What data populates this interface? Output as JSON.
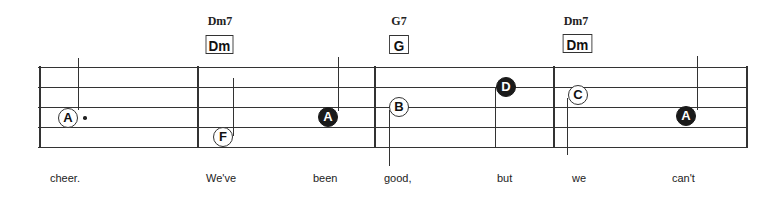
{
  "chords": [
    {
      "name": "Dm7",
      "box": "Dm"
    },
    {
      "name": "G7",
      "box": "G"
    },
    {
      "name": "Dm7",
      "box": "Dm"
    }
  ],
  "notes": [
    {
      "letter": "A",
      "style": "open",
      "dotted": true
    },
    {
      "letter": "F",
      "style": "open",
      "dotted": false
    },
    {
      "letter": "A",
      "style": "filled",
      "dotted": false
    },
    {
      "letter": "B",
      "style": "open",
      "dotted": false
    },
    {
      "letter": "D",
      "style": "filled",
      "dotted": false
    },
    {
      "letter": "C",
      "style": "open",
      "dotted": false
    },
    {
      "letter": "A",
      "style": "filled",
      "dotted": false
    }
  ],
  "lyrics": [
    "cheer.",
    "We've",
    "been",
    "good,",
    "but",
    "we",
    "can't"
  ],
  "colors": {
    "ink": "#1a1a1a",
    "background": "#ffffff"
  }
}
